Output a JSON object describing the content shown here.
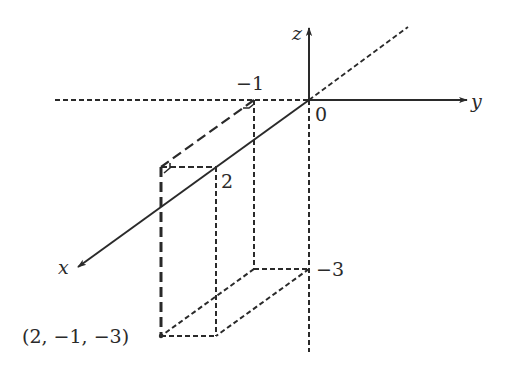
{
  "diagram": {
    "type": "3d-coordinate-axes",
    "axes": {
      "x": {
        "label": "x"
      },
      "y": {
        "label": "y"
      },
      "z": {
        "label": "z"
      }
    },
    "origin_label": "0",
    "tick_labels": {
      "y_neg1": "−1",
      "x_2": "2",
      "z_neg3": "−3"
    },
    "point": {
      "coords": [
        2,
        -1,
        -3
      ],
      "label": "(2, −1, −3)"
    },
    "colors": {
      "line": "#2a2a2a",
      "background": "#ffffff"
    }
  }
}
